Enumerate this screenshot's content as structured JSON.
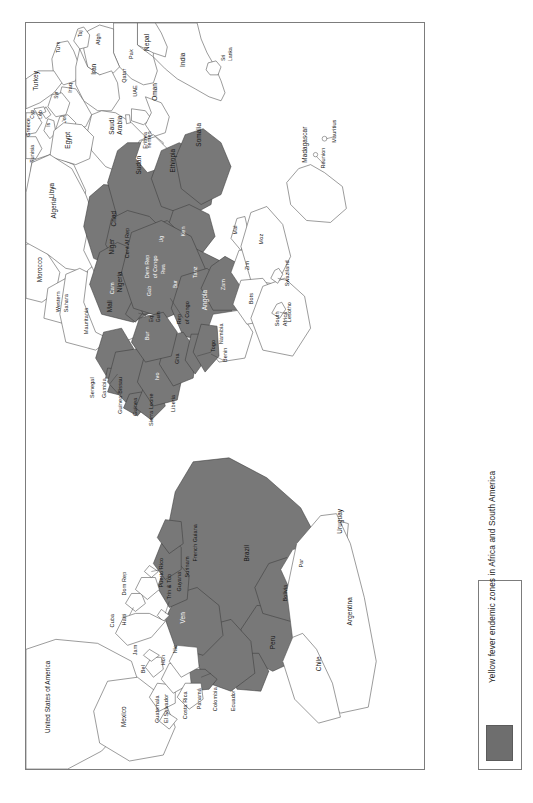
{
  "figure": {
    "kind": "thematic-map",
    "projection_note": "rotated 90 degrees (portrait page, map rendered sideways)",
    "frame_color": "#7c7c7c"
  },
  "legend": {
    "label": "Yellow fever endemic zones in Africa and South America",
    "swatch_color": "#6e6e6e",
    "swatch_meaning": "endemic zone"
  },
  "map": {
    "endemic_fill": "#787878",
    "non_endemic_fill": "#ffffff",
    "border_color": "#4a4a4a",
    "regions": {
      "south_america": [
        {
          "name": "Brazil",
          "endemic": true
        },
        {
          "name": "Peru",
          "endemic": true
        },
        {
          "name": "Bolivia",
          "endemic": true
        },
        {
          "name": "Ven",
          "endemic": true
        },
        {
          "name": "Guyana",
          "endemic": true
        },
        {
          "name": "Surinam",
          "endemic": true
        },
        {
          "name": "French Guiana",
          "endemic": true
        },
        {
          "name": "Colombia",
          "endemic": true
        },
        {
          "name": "Ecuador",
          "endemic": true
        },
        {
          "name": "Panamá",
          "endemic": true
        },
        {
          "name": "Par",
          "endemic": false
        },
        {
          "name": "Argentina",
          "endemic": false
        },
        {
          "name": "Chile",
          "endemic": false
        },
        {
          "name": "Uruguay",
          "endemic": false
        },
        {
          "name": "Trin & Tob",
          "endemic": false
        }
      ],
      "north_central_america": [
        {
          "name": "United States of America",
          "endemic": false
        },
        {
          "name": "Mexico",
          "endemic": false
        },
        {
          "name": "Bel",
          "endemic": false
        },
        {
          "name": "Guatemala",
          "endemic": false
        },
        {
          "name": "El Salvador",
          "endemic": false
        },
        {
          "name": "Hon",
          "endemic": false
        },
        {
          "name": "Nic",
          "endemic": false
        },
        {
          "name": "Costa Rica",
          "endemic": false
        },
        {
          "name": "Cuba",
          "endemic": false
        },
        {
          "name": "Jam",
          "endemic": false
        },
        {
          "name": "Haiti",
          "endemic": false
        },
        {
          "name": "Dom Rep",
          "endemic": false
        },
        {
          "name": "Puerto Rico",
          "endemic": false
        }
      ],
      "africa": [
        {
          "name": "Senegal",
          "endemic": true
        },
        {
          "name": "Gambia",
          "endemic": true
        },
        {
          "name": "Guinea-Bissau",
          "endemic": true
        },
        {
          "name": "Guinea",
          "endemic": true
        },
        {
          "name": "Sierra Leone",
          "endemic": true
        },
        {
          "name": "Liberia",
          "endemic": true
        },
        {
          "name": "Ivo",
          "endemic": true
        },
        {
          "name": "Gha",
          "endemic": true
        },
        {
          "name": "Togo",
          "endemic": true
        },
        {
          "name": "Benin",
          "endemic": true
        },
        {
          "name": "Bur",
          "endemic": true
        },
        {
          "name": "Mali",
          "endemic": false
        },
        {
          "name": "Niger",
          "endemic": false
        },
        {
          "name": "Nigeria",
          "endemic": true
        },
        {
          "name": "Chad",
          "endemic": true
        },
        {
          "name": "Sudan",
          "endemic": true
        },
        {
          "name": "Cent Af Rep",
          "endemic": true
        },
        {
          "name": "Cam",
          "endemic": true
        },
        {
          "name": "Eq Guin",
          "endemic": true
        },
        {
          "name": "Gab",
          "endemic": true
        },
        {
          "name": "Rep of Congo",
          "endemic": true
        },
        {
          "name": "Dem Rep of Congo",
          "endemic": true
        },
        {
          "name": "Angola",
          "endemic": true
        },
        {
          "name": "Ethiopia",
          "endemic": true
        },
        {
          "name": "Somalia",
          "endemic": true
        },
        {
          "name": "Ken",
          "endemic": true
        },
        {
          "name": "Ug",
          "endemic": true
        },
        {
          "name": "Rwa",
          "endemic": true
        },
        {
          "name": "Bur",
          "endemic": true
        },
        {
          "name": "Tanz",
          "endemic": true
        },
        {
          "name": "Eritrea",
          "endemic": false
        },
        {
          "name": "Zam",
          "endemic": true
        },
        {
          "name": "Zim",
          "endemic": false
        },
        {
          "name": "Mal",
          "endemic": false
        },
        {
          "name": "Moz",
          "endemic": false
        },
        {
          "name": "Namibia",
          "endemic": false
        },
        {
          "name": "Bots",
          "endemic": false
        },
        {
          "name": "South Africa",
          "endemic": false
        },
        {
          "name": "Swaziland",
          "endemic": false
        },
        {
          "name": "Lesotho",
          "endemic": false
        },
        {
          "name": "Madagascar",
          "endemic": false
        },
        {
          "name": "Mauritius",
          "endemic": false
        },
        {
          "name": "Réunion",
          "endemic": false
        },
        {
          "name": "Morocco",
          "endemic": false
        },
        {
          "name": "Western Sahara",
          "endemic": false
        },
        {
          "name": "Mauritania",
          "endemic": false
        },
        {
          "name": "Algeria",
          "endemic": false
        },
        {
          "name": "Tunisia",
          "endemic": false
        },
        {
          "name": "Libya",
          "endemic": false
        },
        {
          "name": "Egypt",
          "endemic": false
        }
      ],
      "middle_east_asia_europe": [
        {
          "name": "Turkey",
          "endemic": false
        },
        {
          "name": "Greece",
          "endemic": false
        },
        {
          "name": "Cyp",
          "endemic": false
        },
        {
          "name": "Leb",
          "endemic": false
        },
        {
          "name": "Syr",
          "endemic": false
        },
        {
          "name": "Is",
          "endemic": false
        },
        {
          "name": "Jor",
          "endemic": false
        },
        {
          "name": "Iraq",
          "endemic": false
        },
        {
          "name": "Iran",
          "endemic": false
        },
        {
          "name": "Saudi Arabia",
          "endemic": false
        },
        {
          "name": "Yemen",
          "endemic": false
        },
        {
          "name": "Oman",
          "endemic": false
        },
        {
          "name": "UAE",
          "endemic": false
        },
        {
          "name": "Qatar",
          "endemic": false
        },
        {
          "name": "Turk",
          "endemic": false
        },
        {
          "name": "Taj",
          "endemic": false
        },
        {
          "name": "Afgh",
          "endemic": false
        },
        {
          "name": "Pak",
          "endemic": false
        },
        {
          "name": "Nepal",
          "endemic": false
        },
        {
          "name": "India",
          "endemic": false
        },
        {
          "name": "Sri Lanka",
          "endemic": false
        }
      ]
    }
  },
  "labels": {
    "nepal": "Nepal",
    "india": "India",
    "sri_lanka_1": "Sri",
    "sri_lanka_2": "Lanka",
    "taj": "Taj",
    "pak": "Pak",
    "afgh": "Afgh",
    "turk": "Turk",
    "iran": "Iran",
    "uae": "UAE",
    "oman": "Oman",
    "qatar": "Qatar",
    "qa": "Qa",
    "iraq": "Iraq",
    "saudi_1": "Saudi",
    "saudi_2": "Arabia",
    "yemen": "Yemen",
    "syr": "Syr",
    "jor": "Jor",
    "is": "Is",
    "leb": "Leb",
    "cyp": "Cyp",
    "turkey": "Turkey",
    "greece": "Greece",
    "tunisia": "Tunisia",
    "libya": "Libya",
    "egypt": "Egypt",
    "eritrea": "Eritrea",
    "sudan": "Sudan",
    "ethiopia": "Ethiopia",
    "somalia": "Somalia",
    "ken": "Ken",
    "ug": "Ug",
    "tanz": "Tanz",
    "rwa": "Rwa",
    "bur_e": "Bur",
    "mal": "Mal",
    "moz": "Moz",
    "zim": "Zim",
    "zam": "Zam",
    "bots": "Bots",
    "namibia": "Namibia",
    "angola": "Angola",
    "south_africa_1": "South",
    "south_africa_2": "Africa",
    "swaziland": "Swaziland",
    "lesotho": "Lesotho",
    "madagascar": "Madagascar",
    "mauritius": "Mauritius",
    "reunion": "Réunion",
    "dem_rep_1": "Dem Rep",
    "dem_rep_2": "of Congo",
    "rep_congo_1": "Rep",
    "rep_congo_2": "of Congo",
    "cent_af_rep": "Cent Af Rep",
    "cam": "Cam",
    "gab": "Gab",
    "eq_guin_1": "Eq",
    "eq_guin_2": "Guin",
    "chad": "Chad",
    "niger": "Niger",
    "nigeria": "Nigeria",
    "mali": "Mali",
    "bur_w": "Bur",
    "gha": "Gha",
    "ivo": "Ivo",
    "togo": "Togo",
    "benin": "Benin",
    "liberia": "Liberia",
    "sierra_leone": "Sierra Leone",
    "guinea": "Guinea",
    "guinea_bissau": "Guinea-Bissau",
    "gambia": "Gambia",
    "senegal": "Senegal",
    "mauritania": "Mauritania",
    "western_sahara_1": "Western",
    "western_sahara_2": "Sahara",
    "morocco": "Morocco",
    "algeria": "Algeria",
    "usa": "United States of America",
    "mexico": "Mexico",
    "bel": "Bel",
    "guatemala": "Guatemala",
    "el_salvador": "El Salvador",
    "hon": "Hon",
    "nic": "Nic",
    "costa_rica": "Costa Rica",
    "panama": "Panamá",
    "colombia": "Colombia",
    "ecuador": "Ecuador",
    "cuba": "Cuba",
    "jam": "Jam",
    "haiti": "Haiti",
    "dom_rep": "Dom Rep",
    "puerto_rico": "Puerto Rico",
    "ven": "Ven",
    "trin_tob": "Trin & Tob",
    "guyana": "Guyana",
    "surinam": "Surinam",
    "french_guiana": "French Guiana",
    "brazil": "Brazil",
    "peru": "Peru",
    "bolivia": "Bolivia",
    "par": "Par",
    "chile": "Chile",
    "argentina": "Argentina",
    "uruguay": "Uruguay"
  }
}
